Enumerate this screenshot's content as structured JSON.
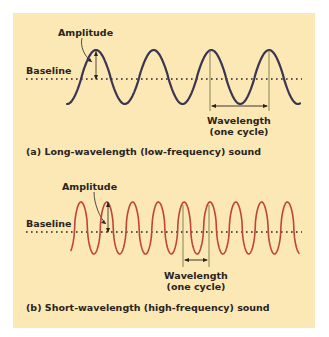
{
  "colors": {
    "background": "#ffffff",
    "panel": "#fbe8b4",
    "wave_a": "#3a3550",
    "wave_b": "#c0443a",
    "text": "#2a2320",
    "guide": "#6a6a40"
  },
  "panel_a": {
    "amplitude_label": "Amplitude",
    "baseline_label": "Baseline",
    "wavelength_label": "Wavelength",
    "wavelength_sub": "(one cycle)",
    "caption": "(a) Long-wavelength (low-frequency) sound"
  },
  "panel_b": {
    "amplitude_label": "Amplitude",
    "baseline_label": "Baseline",
    "wavelength_label": "Wavelength",
    "wavelength_sub": "(one cycle)",
    "caption": "(b) Short-wavelength (high-frequency) sound"
  }
}
